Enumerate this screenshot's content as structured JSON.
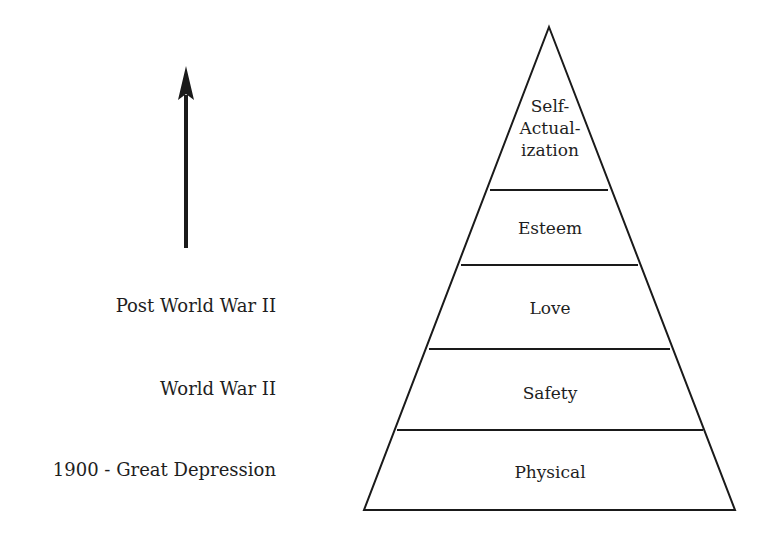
{
  "diagram": {
    "title": "",
    "type": "hierarchy-pyramid",
    "line_color": "#1a1a1a",
    "background": "#ffffff",
    "arrow": {
      "direction": "up",
      "meaning": "progression over time"
    },
    "pyramid_levels": [
      {
        "label_lines": [
          "Self-",
          "Actual-",
          "ization"
        ],
        "label": "Self-Actualization"
      },
      {
        "label": "Esteem"
      },
      {
        "label": "Love"
      },
      {
        "label": "Safety"
      },
      {
        "label": "Physical"
      }
    ],
    "era_labels": [
      {
        "label": "Post World War II",
        "aligned_level": "Love"
      },
      {
        "label": "World War II",
        "aligned_level": "Safety"
      },
      {
        "label": "1900 - Great Depression",
        "aligned_level": "Physical"
      }
    ]
  }
}
